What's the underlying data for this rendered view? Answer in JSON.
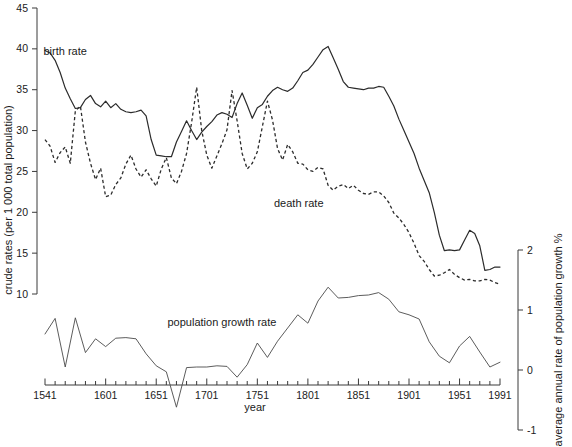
{
  "chart_data": {
    "type": "line",
    "title": "",
    "xlabel": "year",
    "ylabel": "crude rates (per 1 000 total population)",
    "y2label": "average annual rate of population growth %",
    "xlim": [
      1541,
      1991
    ],
    "ylim": [
      10,
      45
    ],
    "y2lim": [
      -1,
      2
    ],
    "grid": false,
    "legend_position": "inline-annotations",
    "xtick_labels": [
      "1541",
      "1601",
      "1651",
      "1701",
      "1751",
      "1801",
      "1851",
      "1901",
      "1951",
      "1991"
    ],
    "xtick_values": [
      1541,
      1601,
      1651,
      1701,
      1751,
      1801,
      1851,
      1901,
      1951,
      1991
    ],
    "xtick_minor_step": 10,
    "ytick_labels": [
      "45",
      "40",
      "35",
      "30",
      "25",
      "20",
      "15",
      "10"
    ],
    "ytick_values": [
      45,
      40,
      35,
      30,
      25,
      20,
      15,
      10
    ],
    "y2tick_labels": [
      "2",
      "1",
      "0",
      "-1"
    ],
    "y2tick_values": [
      2,
      1,
      0,
      -1
    ],
    "annotations": [
      {
        "name": "birth-rate-label",
        "text": "birth rate",
        "x": 1561,
        "y": 39.2
      },
      {
        "name": "death-rate-label",
        "text": "death rate",
        "x": 1792,
        "y": 20.6
      },
      {
        "name": "population-growth-rate-label",
        "text": "population growth rate",
        "x": 1716,
        "y": 0.73
      }
    ],
    "series": [
      {
        "name": "birth rate",
        "style": "solid",
        "axis": "left",
        "unit": "per 1 000 total population",
        "x": [
          1541,
          1546,
          1551,
          1556,
          1561,
          1566,
          1571,
          1576,
          1581,
          1586,
          1591,
          1596,
          1601,
          1606,
          1611,
          1616,
          1621,
          1626,
          1631,
          1636,
          1641,
          1646,
          1651,
          1656,
          1661,
          1666,
          1671,
          1676,
          1681,
          1686,
          1691,
          1696,
          1701,
          1706,
          1711,
          1716,
          1721,
          1726,
          1731,
          1736,
          1741,
          1746,
          1751,
          1756,
          1761,
          1766,
          1771,
          1776,
          1781,
          1786,
          1791,
          1796,
          1801,
          1806,
          1811,
          1816,
          1821,
          1826,
          1831,
          1836,
          1841,
          1846,
          1851,
          1856,
          1861,
          1866,
          1871,
          1876,
          1881,
          1886,
          1891,
          1896,
          1901,
          1906,
          1911,
          1916,
          1921,
          1926,
          1931,
          1936,
          1941,
          1946,
          1951,
          1956,
          1961,
          1966,
          1971,
          1976,
          1981,
          1986,
          1991
        ],
        "values": [
          39.8,
          39.5,
          38.6,
          37.1,
          35.2,
          33.9,
          32.7,
          32.8,
          33.8,
          34.3,
          33.3,
          32.9,
          33.6,
          32.8,
          33.3,
          32.6,
          32.3,
          32.2,
          32.3,
          32.5,
          31.8,
          28.9,
          27.0,
          26.9,
          26.8,
          26.8,
          28.6,
          29.9,
          31.2,
          30.0,
          28.9,
          29.8,
          30.5,
          31.1,
          31.9,
          32.2,
          32.0,
          31.6,
          33.3,
          34.6,
          33.1,
          31.5,
          32.8,
          33.2,
          34.2,
          34.9,
          35.3,
          35.0,
          34.8,
          35.2,
          36.1,
          37.1,
          37.4,
          38.1,
          39.0,
          39.9,
          40.3,
          38.9,
          37.5,
          36.0,
          35.3,
          35.2,
          35.1,
          35.0,
          35.2,
          35.2,
          35.4,
          35.3,
          34.2,
          33.0,
          31.4,
          30.0,
          28.6,
          27.2,
          25.4,
          23.9,
          22.4,
          20.0,
          17.2,
          15.3,
          15.4,
          15.3,
          15.4,
          16.6,
          17.8,
          17.4,
          15.9,
          12.9,
          13.0,
          13.3,
          13.3
        ]
      },
      {
        "name": "death rate",
        "style": "dashed",
        "axis": "left",
        "unit": "per 1 000 total population",
        "x": [
          1541,
          1546,
          1551,
          1556,
          1561,
          1566,
          1571,
          1576,
          1581,
          1586,
          1591,
          1596,
          1601,
          1606,
          1611,
          1616,
          1621,
          1626,
          1631,
          1636,
          1641,
          1646,
          1651,
          1656,
          1661,
          1666,
          1671,
          1676,
          1681,
          1686,
          1691,
          1696,
          1701,
          1706,
          1711,
          1716,
          1721,
          1726,
          1731,
          1736,
          1741,
          1746,
          1751,
          1756,
          1761,
          1766,
          1771,
          1776,
          1781,
          1786,
          1791,
          1796,
          1801,
          1806,
          1811,
          1816,
          1821,
          1826,
          1831,
          1836,
          1841,
          1846,
          1851,
          1856,
          1861,
          1866,
          1871,
          1876,
          1881,
          1886,
          1891,
          1896,
          1901,
          1906,
          1911,
          1916,
          1921,
          1926,
          1931,
          1936,
          1941,
          1946,
          1951,
          1956,
          1961,
          1966,
          1971,
          1976,
          1981,
          1986,
          1991
        ],
        "values": [
          28.9,
          28.1,
          26.1,
          27.3,
          28.0,
          26.0,
          32.4,
          33.0,
          28.6,
          26.0,
          24.0,
          25.4,
          21.9,
          22.1,
          23.4,
          24.2,
          25.9,
          27.0,
          25.3,
          24.3,
          25.2,
          24.1,
          23.2,
          25.3,
          26.7,
          24.2,
          23.5,
          25.0,
          27.2,
          31.0,
          35.3,
          30.0,
          27.0,
          25.4,
          26.9,
          28.4,
          30.1,
          34.9,
          31.2,
          27.2,
          25.3,
          26.0,
          27.4,
          30.5,
          33.6,
          31.3,
          27.8,
          26.4,
          28.3,
          27.4,
          26.0,
          25.9,
          25.2,
          25.0,
          25.5,
          25.3,
          23.3,
          22.7,
          23.2,
          23.4,
          22.9,
          23.3,
          22.7,
          22.3,
          22.2,
          22.5,
          22.5,
          22.0,
          21.2,
          19.9,
          19.3,
          18.5,
          17.5,
          16.2,
          14.7,
          14.0,
          13.0,
          12.2,
          12.3,
          12.6,
          13.0,
          12.4,
          12.0,
          11.7,
          11.8,
          11.6,
          11.6,
          11.8,
          11.7,
          11.4,
          11.2
        ]
      },
      {
        "name": "population growth rate",
        "style": "thin-solid",
        "axis": "right",
        "unit": "average annual rate of population growth %",
        "x": [
          1541,
          1551,
          1561,
          1571,
          1581,
          1591,
          1601,
          1611,
          1621,
          1631,
          1641,
          1651,
          1661,
          1671,
          1681,
          1691,
          1701,
          1711,
          1721,
          1731,
          1741,
          1751,
          1761,
          1771,
          1781,
          1791,
          1801,
          1811,
          1821,
          1831,
          1841,
          1851,
          1861,
          1871,
          1881,
          1891,
          1901,
          1911,
          1921,
          1931,
          1941,
          1951,
          1961,
          1971,
          1981,
          1991
        ],
        "values": [
          0.6,
          0.86,
          0.05,
          0.87,
          0.29,
          0.52,
          0.39,
          0.53,
          0.54,
          0.52,
          0.27,
          0.07,
          -0.03,
          -0.62,
          0.04,
          0.05,
          0.05,
          0.07,
          0.06,
          -0.12,
          0.09,
          0.45,
          0.21,
          0.48,
          0.7,
          0.92,
          0.78,
          1.15,
          1.38,
          1.2,
          1.21,
          1.24,
          1.25,
          1.29,
          1.18,
          0.97,
          0.92,
          0.85,
          0.47,
          0.23,
          0.12,
          0.4,
          0.56,
          0.3,
          0.05,
          0.13
        ]
      }
    ]
  },
  "axes": {
    "left": {
      "title": "crude rates (per 1 000 total population)",
      "labels": [
        "45",
        "40",
        "35",
        "30",
        "25",
        "20",
        "15",
        "10"
      ]
    },
    "bottom": {
      "title": "year",
      "labels": [
        "1541",
        "1601",
        "1651",
        "1701",
        "1751",
        "1801",
        "1851",
        "1901",
        "1951",
        "1991"
      ]
    },
    "right": {
      "title": "average annual rate of population growth %",
      "labels": [
        "2",
        "1",
        "0",
        "-1"
      ]
    }
  }
}
